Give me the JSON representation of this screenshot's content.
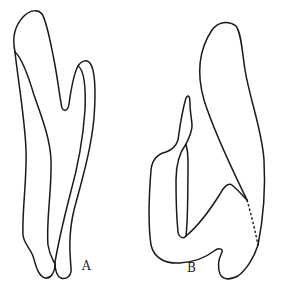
{
  "figure": {
    "type": "line-drawing",
    "panels": [
      {
        "id": "A",
        "label": "A",
        "description": "Elongated two-pronged outline with forked top and fused bottom"
      },
      {
        "id": "B",
        "label": "B",
        "description": "Hook-shaped outline with large upper lobe, small left prong, inner loop and dashed boundary line"
      }
    ],
    "colors": {
      "stroke": "#1a1a1a",
      "background": "#ffffff"
    }
  }
}
